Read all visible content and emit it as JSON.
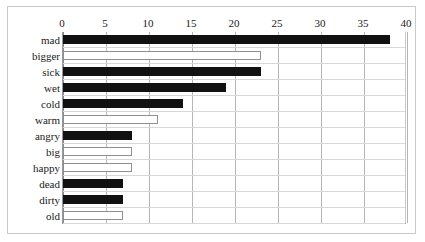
{
  "chart_data": {
    "type": "bar",
    "orientation": "horizontal",
    "title": "",
    "subtitle": "",
    "xlabel": "",
    "ylabel": "",
    "xlim": [
      0,
      40
    ],
    "ylim": null,
    "grid": true,
    "legend": null,
    "legend_position": "none",
    "xticks": [
      0,
      5,
      10,
      15,
      20,
      25,
      30,
      35,
      40
    ],
    "xtick_labels": [
      "0",
      "5",
      "10",
      "15",
      "20",
      "25",
      "30",
      "35",
      "40"
    ],
    "categories": [
      "mad",
      "bigger",
      "sick",
      "wet",
      "cold",
      "warm",
      "angry",
      "big",
      "happy",
      "dead",
      "dirty",
      "old"
    ],
    "values": [
      38,
      23,
      23,
      19,
      14,
      11,
      8,
      8,
      8,
      7,
      7,
      7
    ],
    "bar_fills": [
      "black",
      "white",
      "black",
      "black",
      "black",
      "white",
      "black",
      "white",
      "white",
      "black",
      "black",
      "white"
    ],
    "colors": {
      "filled_bar": "#111111",
      "hollow_bar_face": "#ffffff",
      "hollow_bar_edge": "#8f8f8f",
      "gridline": "#b5b5b5",
      "axis": "#8a8a8a",
      "frame": "#c9c9c9",
      "text": "#1a1a1a",
      "background": "#ffffff"
    }
  }
}
